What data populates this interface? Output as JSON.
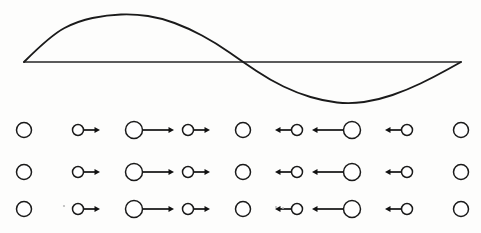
{
  "figure": {
    "background_color": "#fdfdfc",
    "stroke_color": "#1a1a1a",
    "width": 481,
    "height": 233
  },
  "wave": {
    "name": "sine-wave",
    "type": "sine",
    "baseline_y": 62,
    "x_start": 24,
    "x_end": 461,
    "peak": {
      "x": 135,
      "y": 14
    },
    "zero_crossing": {
      "x": 243,
      "y": 62
    },
    "trough": {
      "x": 350,
      "y": 104
    },
    "amplitude_up": 48,
    "amplitude_down": 42,
    "cycles": 1,
    "stroke_width": 1.9,
    "color": "#1a1a1a"
  },
  "axis": {
    "name": "equilibrium-axis",
    "y": 62,
    "x_start": 24,
    "x_end": 461,
    "color": "#262626"
  },
  "particle_grid": {
    "rows": [
      {
        "label": "row-1",
        "y": 130
      },
      {
        "label": "row-2",
        "y": 172
      },
      {
        "label": "row-3",
        "y": 209
      }
    ],
    "columns": [
      {
        "index": 1,
        "x": 24,
        "radius": 7.5,
        "arrow_direction": "none",
        "arrow_length": 0
      },
      {
        "index": 2,
        "x": 78,
        "radius": 5.5,
        "arrow_direction": "right",
        "arrow_length": 16
      },
      {
        "index": 3,
        "x": 134,
        "radius": 8.5,
        "arrow_direction": "right",
        "arrow_length": 31
      },
      {
        "index": 4,
        "x": 188,
        "radius": 5.5,
        "arrow_direction": "right",
        "arrow_length": 16
      },
      {
        "index": 5,
        "x": 243,
        "radius": 7.5,
        "arrow_direction": "none",
        "arrow_length": 0
      },
      {
        "index": 6,
        "x": 297,
        "radius": 5.5,
        "arrow_direction": "left",
        "arrow_length": 16
      },
      {
        "index": 7,
        "x": 352,
        "radius": 8.5,
        "arrow_direction": "left",
        "arrow_length": 31
      },
      {
        "index": 8,
        "x": 407,
        "radius": 5.5,
        "arrow_direction": "left",
        "arrow_length": 16
      },
      {
        "index": 9,
        "x": 461,
        "radius": 7.5,
        "arrow_direction": "none",
        "arrow_length": 0
      }
    ],
    "circle_fill": "#ffffff",
    "circle_stroke": "#1a1a1a",
    "arrow_color": "#111111"
  },
  "chart_data": {
    "type": "line",
    "title": "",
    "xlabel": "",
    "ylabel": "",
    "grid": false,
    "legend": "none",
    "xlim": [
      24,
      461
    ],
    "ylim": [
      -42,
      48
    ],
    "series": [
      {
        "name": "wave-displacement",
        "x": [
          24,
          51,
          78,
          107,
          135,
          161,
          188,
          216,
          243,
          270,
          297,
          324,
          350,
          378,
          407,
          434,
          461
        ],
        "y": [
          0,
          27,
          41,
          47,
          48,
          44,
          34,
          19,
          0,
          -18,
          -31,
          -39,
          -42,
          -38,
          -28,
          -15,
          0
        ]
      }
    ],
    "annotations": [
      {
        "name": "peak-marker",
        "x": 135,
        "y": 48,
        "text": ""
      },
      {
        "name": "trough-marker",
        "x": 350,
        "y": -42,
        "text": ""
      }
    ]
  },
  "specks": [
    {
      "x": 64,
      "y": 206,
      "r": 1.1
    },
    {
      "x": 276,
      "y": 207,
      "r": 1.0
    },
    {
      "x": 283,
      "y": 208,
      "r": 0.9
    }
  ]
}
